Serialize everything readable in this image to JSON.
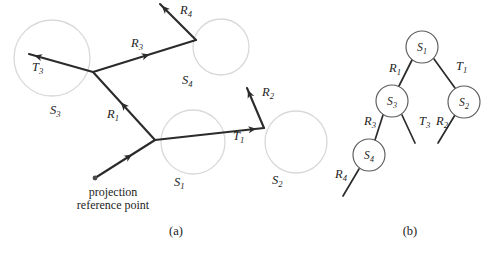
{
  "figure": {
    "background_color": "#ffffff",
    "ink_color": "#2b2b2b",
    "surface_outline_color": "#d9d9d9",
    "node_outline_color": "#5b5b5b",
    "panels": [
      {
        "id": "a",
        "caption": "(a)",
        "caption_x": 176,
        "caption_y": 235
      },
      {
        "id": "b",
        "caption": "(b)",
        "caption_x": 410,
        "caption_y": 235
      }
    ]
  },
  "panel_a": {
    "title_note": "ray tree traced through spherical surfaces",
    "projection_reference_point": {
      "label_line1": "projection",
      "label_line2": "reference point",
      "x": 95,
      "y": 178,
      "text_x": 113,
      "text_y1": 196,
      "text_y2": 209
    },
    "surfaces": [
      {
        "name": "S3",
        "letter": "S",
        "sub": "3",
        "cx": 52,
        "cy": 58,
        "r": 38,
        "label_x": 50,
        "label_y": 114
      },
      {
        "name": "S4",
        "letter": "S",
        "sub": "4",
        "cx": 221,
        "cy": 47,
        "r": 28,
        "label_x": 182,
        "label_y": 84
      },
      {
        "name": "S1",
        "letter": "S",
        "sub": "1",
        "cx": 193,
        "cy": 142,
        "r": 32,
        "label_x": 174,
        "label_y": 186
      },
      {
        "name": "S2",
        "letter": "S",
        "sub": "2",
        "cx": 296,
        "cy": 142,
        "r": 31,
        "label_x": 272,
        "label_y": 184
      }
    ],
    "rays": [
      {
        "name": "R1",
        "letter": "R",
        "sub": "1",
        "label_x": 107,
        "label_y": 118,
        "from_x": 155,
        "from_y": 140,
        "to_x": 93,
        "to_y": 72,
        "arrow_t": 0.55
      },
      {
        "name": "R3",
        "letter": "R",
        "sub": "3",
        "label_x": 131,
        "label_y": 47,
        "from_x": 93,
        "from_y": 72,
        "to_x": 196,
        "to_y": 40,
        "arrow_t": 0.55
      },
      {
        "name": "R4",
        "letter": "R",
        "sub": "4",
        "label_x": 180,
        "label_y": 14,
        "from_x": 196,
        "from_y": 40,
        "to_x": 160,
        "to_y": 4,
        "arrow_t": 0.95
      },
      {
        "name": "R2",
        "letter": "R",
        "sub": "2",
        "label_x": 262,
        "label_y": 96,
        "from_x": 264,
        "from_y": 128,
        "to_x": 247,
        "to_y": 88,
        "arrow_t": 0.95
      },
      {
        "name": "T3",
        "letter": "T",
        "sub": "3",
        "label_x": 32,
        "label_y": 71,
        "from_x": 93,
        "from_y": 72,
        "to_x": 29,
        "to_y": 54,
        "arrow_t": 0.92
      },
      {
        "name": "T1",
        "letter": "T",
        "sub": "1",
        "label_x": 233,
        "label_y": 140,
        "from_x": 155,
        "from_y": 140,
        "to_x": 264,
        "to_y": 128,
        "arrow_t": 0.93
      },
      {
        "name": "PRP-to-S1",
        "letter": "",
        "sub": "",
        "label_x": 0,
        "label_y": 0,
        "from_x": 95,
        "from_y": 178,
        "to_x": 155,
        "to_y": 140,
        "arrow_t": 0.62
      }
    ]
  },
  "panel_b": {
    "title_note": "corresponding binary ray tree",
    "node_radius": 16,
    "nodes": [
      {
        "name": "S1",
        "letter": "S",
        "sub": "1",
        "cx": 422,
        "cy": 47
      },
      {
        "name": "S3",
        "letter": "S",
        "sub": "3",
        "cx": 392,
        "cy": 101
      },
      {
        "name": "S2",
        "letter": "S",
        "sub": "2",
        "cx": 464,
        "cy": 102
      },
      {
        "name": "S4",
        "letter": "S",
        "sub": "4",
        "cx": 369,
        "cy": 155
      }
    ],
    "edges": [
      {
        "name": "R1",
        "letter": "R",
        "sub": "1",
        "from_x": 412,
        "from_y": 60,
        "to_x": 399,
        "to_y": 86,
        "label_x": 389,
        "label_y": 72
      },
      {
        "name": "T1",
        "letter": "T",
        "sub": "1",
        "from_x": 434,
        "from_y": 59,
        "to_x": 455,
        "to_y": 88,
        "label_x": 456,
        "label_y": 70
      },
      {
        "name": "R3",
        "letter": "R",
        "sub": "3",
        "from_x": 383,
        "from_y": 115,
        "to_x": 375,
        "to_y": 140,
        "label_x": 364,
        "label_y": 125
      },
      {
        "name": "T3",
        "letter": "T",
        "sub": "3",
        "from_x": 402,
        "from_y": 115,
        "to_x": 415,
        "to_y": 143,
        "label_x": 419,
        "label_y": 125
      },
      {
        "name": "R2",
        "letter": "R",
        "sub": "2",
        "from_x": 455,
        "from_y": 115,
        "to_x": 438,
        "to_y": 143,
        "label_x": 436,
        "label_y": 125
      },
      {
        "name": "R4",
        "letter": "R",
        "sub": "4",
        "from_x": 359,
        "from_y": 169,
        "to_x": 343,
        "to_y": 196,
        "label_x": 335,
        "label_y": 178
      }
    ]
  }
}
